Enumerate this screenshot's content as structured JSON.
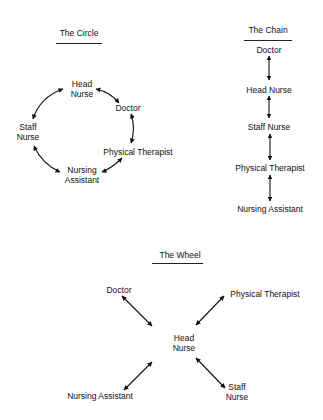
{
  "circle": {
    "title": "The Circle",
    "nodes": {
      "head_nurse": [
        "Head",
        "Nurse"
      ],
      "doctor": "Doctor",
      "staff_nurse": [
        "Staff",
        "Nurse"
      ],
      "physical_therapist": "Physical  Therapist",
      "nursing_assistant": [
        "Nursing",
        "Assistant"
      ]
    },
    "edges": [
      [
        "Head Nurse",
        "Doctor"
      ],
      [
        "Doctor",
        "Physical Therapist"
      ],
      [
        "Physical Therapist",
        "Nursing Assistant"
      ],
      [
        "Nursing Assistant",
        "Staff Nurse"
      ],
      [
        "Staff Nurse",
        "Head Nurse"
      ]
    ]
  },
  "chain": {
    "title": "The Chain",
    "nodes": [
      "Doctor",
      "Head Nurse",
      "Staff Nurse",
      "Physical Therapist",
      "Nursing Assistant"
    ],
    "edges": [
      [
        "Doctor",
        "Head Nurse"
      ],
      [
        "Head Nurse",
        "Staff Nurse"
      ],
      [
        "Staff Nurse",
        "Physical Therapist"
      ],
      [
        "Physical Therapist",
        "Nursing Assistant"
      ]
    ]
  },
  "wheel": {
    "title": "The Wheel",
    "center": [
      "Head",
      "Nurse"
    ],
    "nodes": {
      "doctor": "Doctor",
      "physical_therapist": "Physical  Therapist",
      "nursing_assistant": "Nursing Assistant",
      "staff_nurse": [
        "Staff",
        "Nurse"
      ]
    },
    "edges": [
      [
        "Head Nurse",
        "Doctor"
      ],
      [
        "Head Nurse",
        "Physical Therapist"
      ],
      [
        "Head Nurse",
        "Nursing Assistant"
      ],
      [
        "Head Nurse",
        "Staff Nurse"
      ]
    ]
  }
}
